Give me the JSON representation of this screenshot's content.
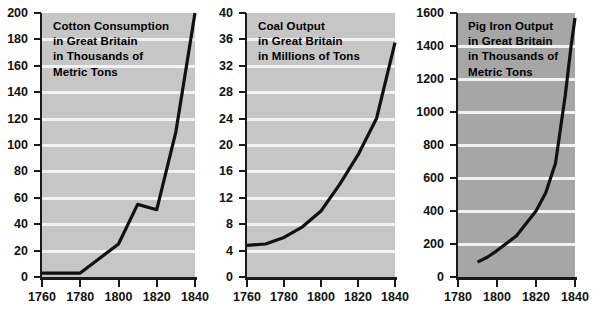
{
  "figure": {
    "background": "#ffffff",
    "panel_count": 3
  },
  "charts": [
    {
      "id": "cotton-consumption",
      "title_lines": [
        "Cotton Consumption",
        "in Great Britain",
        "in Thousands of",
        "Metric Tons"
      ],
      "plot_background": "#c6c6c6",
      "grid_color": "#f2f2f2",
      "line_color": "#111111",
      "y_ticks": [
        0,
        20,
        40,
        60,
        80,
        100,
        120,
        140,
        160,
        180,
        200
      ],
      "x_ticks": [
        1760,
        1780,
        1800,
        1820,
        1840
      ],
      "chart_data": {
        "type": "line",
        "title": "Cotton Consumption in Great Britain in Thousands of Metric Tons",
        "xlabel": "",
        "ylabel": "Thousands of Metric Tons",
        "xlim": [
          1760,
          1840
        ],
        "ylim": [
          0,
          200
        ],
        "grid": true,
        "legend": "none",
        "x": [
          1760,
          1780,
          1790,
          1800,
          1810,
          1820,
          1830,
          1840
        ],
        "y": [
          3,
          3,
          14,
          25,
          55,
          51,
          110,
          200
        ]
      }
    },
    {
      "id": "coal-output",
      "title_lines": [
        "Coal Output",
        "in Great Britain",
        "in Millions of Tons"
      ],
      "plot_background": "#c6c6c6",
      "grid_color": "#f2f2f2",
      "line_color": "#111111",
      "y_ticks": [
        0,
        4,
        8,
        12,
        16,
        20,
        24,
        28,
        32,
        36,
        40
      ],
      "x_ticks": [
        1760,
        1780,
        1800,
        1820,
        1840
      ],
      "chart_data": {
        "type": "line",
        "title": "Coal Output in Great Britain in Millions of Tons",
        "xlabel": "",
        "ylabel": "Millions of Tons",
        "xlim": [
          1760,
          1840
        ],
        "ylim": [
          0,
          40
        ],
        "grid": true,
        "legend": "none",
        "x": [
          1760,
          1770,
          1780,
          1790,
          1800,
          1810,
          1820,
          1830,
          1840
        ],
        "y": [
          4.8,
          5.0,
          6.0,
          7.6,
          10.0,
          14.0,
          18.5,
          24.0,
          35.5
        ]
      }
    },
    {
      "id": "pig-iron-output",
      "title_lines": [
        "Pig Iron Output",
        "in Great Britain",
        "in Thousands of",
        "Metric Tons"
      ],
      "plot_background": "#a6a6a6",
      "grid_color": "#f2f2f2",
      "line_color": "#111111",
      "y_ticks": [
        0,
        200,
        400,
        600,
        800,
        1000,
        1200,
        1400,
        1600
      ],
      "x_ticks": [
        1780,
        1800,
        1820,
        1840
      ],
      "chart_data": {
        "type": "line",
        "title": "Pig Iron Output in Great Britain in Thousands of Metric Tons",
        "xlabel": "",
        "ylabel": "Thousands of Metric Tons",
        "xlim": [
          1780,
          1840
        ],
        "ylim": [
          0,
          1600
        ],
        "grid": true,
        "legend": "none",
        "x": [
          1790,
          1795,
          1800,
          1810,
          1820,
          1825,
          1830,
          1835,
          1838,
          1840
        ],
        "y": [
          90,
          120,
          160,
          250,
          400,
          510,
          690,
          1100,
          1400,
          1570
        ]
      }
    }
  ]
}
